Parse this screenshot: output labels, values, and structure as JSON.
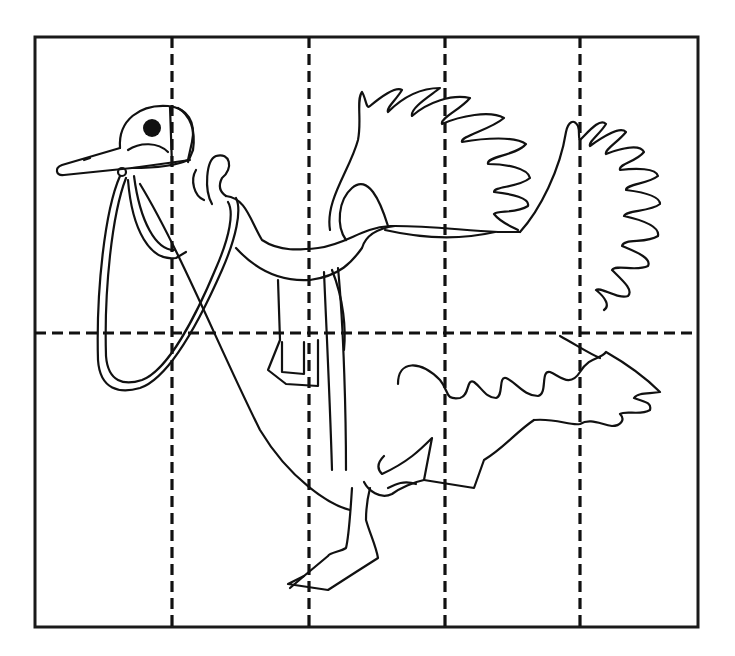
{
  "page": {
    "type": "cut-apart puzzle worksheet",
    "top_caption": ""
  },
  "puzzle": {
    "frame": {
      "x": 35,
      "y": 37,
      "width": 663,
      "height": 590
    },
    "columns": 5,
    "rows": 2,
    "vertical_cut_lines_x": [
      172,
      309,
      445,
      580
    ],
    "horizontal_cut_lines_y": [
      333
    ],
    "line_color": "#111111",
    "background": "#ffffff"
  }
}
